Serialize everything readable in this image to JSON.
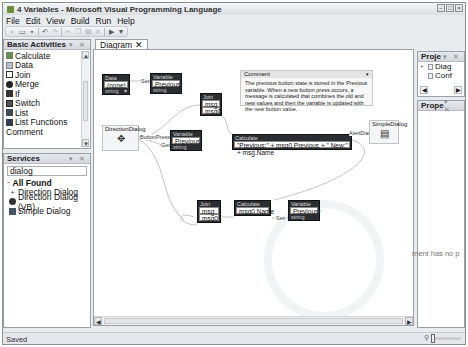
{
  "window": {
    "title": "4 Variables - Microsoft Visual Programming Language",
    "controls": [
      "minimize",
      "maximize",
      "close"
    ]
  },
  "menu": [
    {
      "label": "File",
      "accel": "F"
    },
    {
      "label": "Edit",
      "accel": "E"
    },
    {
      "label": "View",
      "accel": "V"
    },
    {
      "label": "Build",
      "accel": "B"
    },
    {
      "label": "Run",
      "accel": "R"
    },
    {
      "label": "Help",
      "accel": "H"
    }
  ],
  "toolbar": {
    "buttons": [
      "new-icon",
      "open-icon",
      "save-icon",
      "undo-icon",
      "redo-icon",
      "cut-icon",
      "copy-icon",
      "paste-icon",
      "delete-icon",
      "run-icon",
      "debug-icon"
    ]
  },
  "basic_activities": {
    "title": "Basic Activities",
    "items": [
      {
        "label": "Calculate",
        "icon": "calculate-icon"
      },
      {
        "label": "Data",
        "icon": "data-icon"
      },
      {
        "label": "Join",
        "icon": "join-icon"
      },
      {
        "label": "Merge",
        "icon": "merge-icon"
      },
      {
        "label": "If",
        "icon": "if-icon"
      },
      {
        "label": "Switch",
        "icon": "switch-icon"
      },
      {
        "label": "List",
        "icon": "list-icon"
      },
      {
        "label": "List Functions",
        "icon": "list-functions-icon"
      },
      {
        "label": "Comment",
        "icon": "comment-icon"
      }
    ]
  },
  "services": {
    "title": "Services",
    "search_value": "dialog",
    "root": "All Found",
    "items": [
      {
        "label": "Direction Dialog",
        "icon": "direction-dialog-icon"
      },
      {
        "label": "Direction Dialog (VB)",
        "icon": "direction-dialog-vb-icon"
      },
      {
        "label": "Simple Dialog",
        "icon": "simple-dialog-icon"
      }
    ]
  },
  "document": {
    "tab_label": "Diagram",
    "comment": {
      "title": "Comment",
      "text": "The previous button state is stored in the Previous variable. When a new button press occurs, a message is calculated that combines the old and new values and then the variable is updated with the new button value."
    },
    "blocks": {
      "data1": {
        "header": "Data",
        "value": "(none)",
        "type": "string"
      },
      "var1": {
        "header": "Variable",
        "value": "Previous",
        "type": "string"
      },
      "join1": {
        "header": "Join",
        "fields": [
          "msg",
          "msg0"
        ]
      },
      "direction": {
        "header": "DirectionDialog"
      },
      "var2": {
        "header": "Variable",
        "value": "Previous",
        "type": "string"
      },
      "calc1": {
        "header": "Calculate",
        "expr": "\"Previous:\" + msg0.Previous + \"  New:\" + msg.Name"
      },
      "simple": {
        "header": "SimpleDialog"
      },
      "join2": {
        "header": "Join",
        "fields": [
          "msg",
          "msg0"
        ]
      },
      "calc2": {
        "header": "Calculate",
        "expr": "msg0.Name"
      },
      "var3": {
        "header": "Variable",
        "value": "Previous",
        "type": "string"
      }
    },
    "connection_labels": {
      "set1": "Set",
      "button_press": "ButtonPress",
      "get": "Get",
      "alert": "AlertDialog",
      "set2": "Set"
    }
  },
  "project_panel": {
    "title": "Proje",
    "items": [
      {
        "label": "Diag",
        "expander": "+"
      },
      {
        "label": "Conf",
        "expander": ""
      }
    ]
  },
  "properties_panel": {
    "title": "Prope",
    "message": "ment has no p"
  },
  "status": {
    "text": "Saved"
  }
}
